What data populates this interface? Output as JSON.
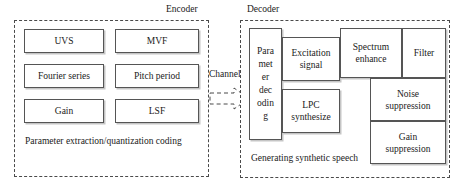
{
  "diagram": {
    "title_visible": false,
    "colors": {
      "box_border": "#555555",
      "group_border": "#4a4a4a",
      "text": "#1a1a1a",
      "background": "#ffffff",
      "shadow": "rgba(150,150,150,0.55)"
    },
    "encoder": {
      "label": "Encoder",
      "caption": "Parameter extraction/quantization coding",
      "boxes": [
        {
          "label": "UVS"
        },
        {
          "label": "MVF"
        },
        {
          "label": "Fourier series"
        },
        {
          "label": "Pitch period"
        },
        {
          "label": "Gain"
        },
        {
          "label": "LSF"
        }
      ]
    },
    "channel": {
      "label": "Channel",
      "arrow_icon": "dashed-block-arrow-right"
    },
    "decoder": {
      "label": "Decoder",
      "caption": "Generating synthetic speech",
      "boxes": [
        {
          "label": "Para\nmet\ner\ndec\nodin\ng"
        },
        {
          "label": "Excitation\nsignal"
        },
        {
          "label": "Spectrum\nenhance"
        },
        {
          "label": "Filter"
        },
        {
          "label": "LPC\nsynthesize"
        },
        {
          "label": "Noise\nsuppression"
        },
        {
          "label": "Gain\nsuppression"
        }
      ]
    }
  }
}
